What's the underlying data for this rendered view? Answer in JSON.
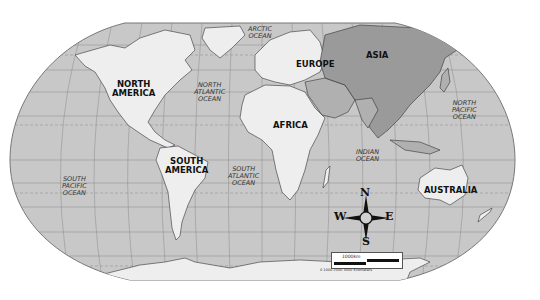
{
  "map": {
    "title": "World Map",
    "projection": "Robinson",
    "colors": {
      "ocean": "#c8c8c8",
      "land_light": "#eeeeee",
      "land_asia": "#9a9a9a",
      "land_middle_east": "#b0b0b0",
      "border": "#333333",
      "graticule": "#8a8a8a",
      "outline": "#777777"
    },
    "continents": [
      {
        "id": "north-america",
        "line1": "NORTH",
        "line2": "AMERICA"
      },
      {
        "id": "south-america",
        "line1": "SOUTH",
        "line2": "AMERICA"
      },
      {
        "id": "europe",
        "line1": "EUROPE"
      },
      {
        "id": "africa",
        "line1": "AFRICA"
      },
      {
        "id": "asia",
        "line1": "ASIA"
      },
      {
        "id": "australia",
        "line1": "AUSTRALIA"
      }
    ],
    "oceans": [
      {
        "id": "arctic",
        "line1": "ARCTIC",
        "line2": "OCEAN"
      },
      {
        "id": "north-atlantic",
        "line1": "NORTH",
        "line2": "ATLANTIC",
        "line3": "OCEAN"
      },
      {
        "id": "south-atlantic",
        "line1": "SOUTH",
        "line2": "ATLANTIC",
        "line3": "OCEAN"
      },
      {
        "id": "north-pacific",
        "line1": "NORTH",
        "line2": "PACIFIC",
        "line3": "OCEAN"
      },
      {
        "id": "south-pacific",
        "line1": "SOUTH",
        "line2": "PACIFIC",
        "line3": "OCEAN"
      },
      {
        "id": "indian",
        "line1": "INDIAN",
        "line2": "OCEAN"
      }
    ],
    "compass": {
      "n": "N",
      "s": "S",
      "e": "E",
      "w": "W"
    },
    "scale": {
      "label": "1000km",
      "ticks": "0    1000   2000   3000 Kilometers"
    }
  }
}
